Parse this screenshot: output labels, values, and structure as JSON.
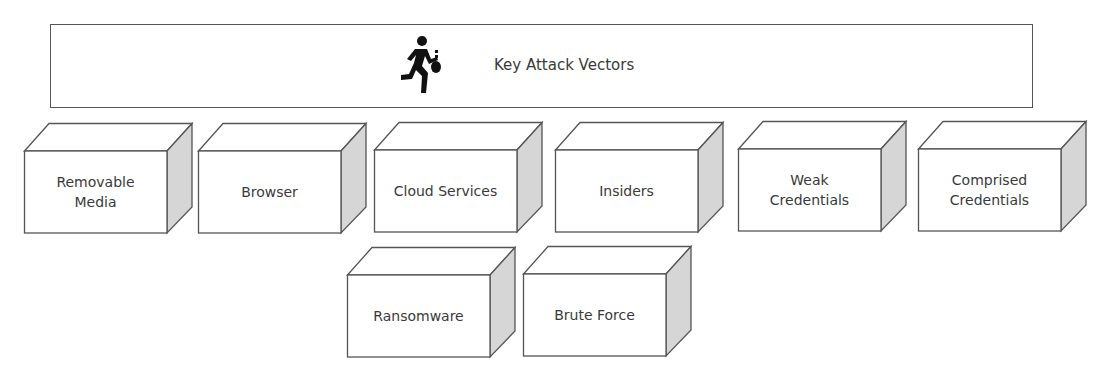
{
  "header": {
    "title": "Key Attack Vectors",
    "icon": "running-thief-icon"
  },
  "colors": {
    "border": "#555555",
    "side_face": "#d6d6d6",
    "front_face": "#ffffff",
    "text": "#3a3a3a"
  },
  "vectors": [
    {
      "label": "Removable\nMedia"
    },
    {
      "label": "Browser"
    },
    {
      "label": "Cloud Services"
    },
    {
      "label": "Insiders"
    },
    {
      "label": "Weak\nCredentials"
    },
    {
      "label": "Comprised\nCredentials"
    },
    {
      "label": "Ransomware"
    },
    {
      "label": "Brute Force"
    }
  ]
}
